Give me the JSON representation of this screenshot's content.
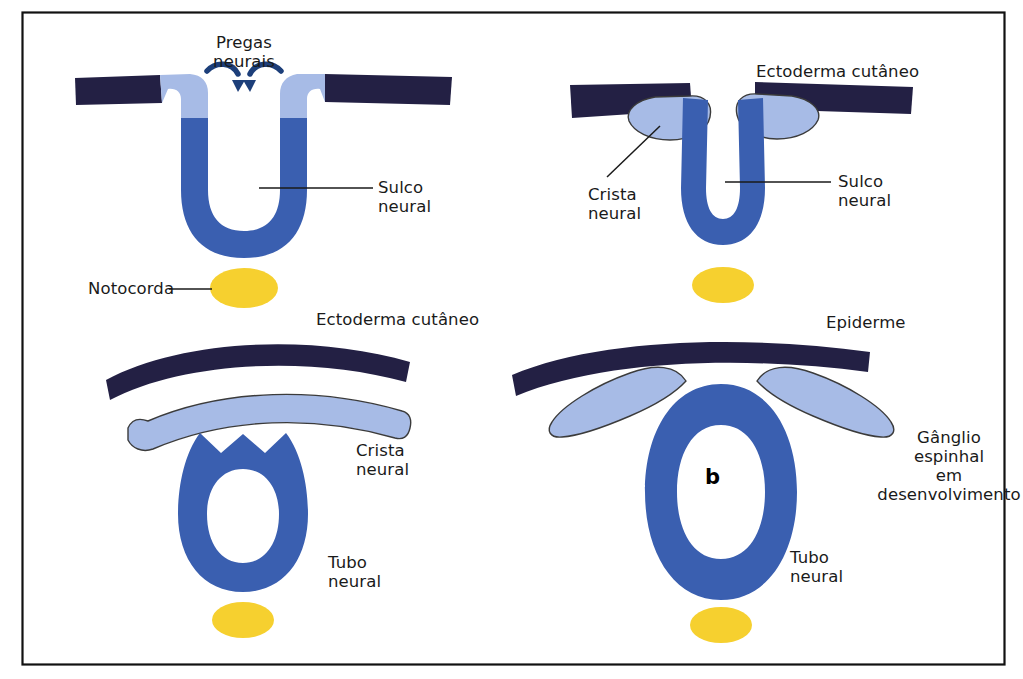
{
  "figure": {
    "panel_letter": "b",
    "frame": {
      "color": "#111111",
      "x": 22,
      "y": 12,
      "width": 983,
      "height": 653
    }
  },
  "colors": {
    "surface_ectoderm": "#232044",
    "neural_plate": "#3a5fb0",
    "neural_crest": "#a7bbe6",
    "neural_crest_outline": "#3b3b3b",
    "notochord": "#f6d02f",
    "leader_line": "#1a1a1a",
    "arrow": "#1d3f7a",
    "background": "#ffffff",
    "text": "#1a1a1a"
  },
  "panels": [
    {
      "id": "panel-top-left",
      "stage": "neural-groove-folding",
      "labels": [
        {
          "name": "pregas-neurais",
          "text": "Pregas\nneurais",
          "x": 236,
          "y": 33,
          "align": "center"
        },
        {
          "name": "sulco-neural",
          "text": "Sulco\nneural",
          "x": 378,
          "y": 178,
          "align": "left"
        },
        {
          "name": "notocorda",
          "text": "Notocorda",
          "x": 88,
          "y": 279,
          "align": "left"
        }
      ],
      "annotations": [
        "arrow-left-fold",
        "arrow-right-fold"
      ]
    },
    {
      "id": "panel-top-right",
      "stage": "neural-crest-forming",
      "labels": [
        {
          "name": "ectoderma-cutaneo",
          "text": "Ectoderma cutâneo",
          "x": 756,
          "y": 62,
          "align": "left"
        },
        {
          "name": "crista-neural",
          "text": "Crista\nneural",
          "x": 588,
          "y": 185,
          "align": "left"
        },
        {
          "name": "sulco-neural",
          "text": "Sulco\nneural",
          "x": 838,
          "y": 172,
          "align": "left"
        }
      ]
    },
    {
      "id": "panel-bottom-left",
      "stage": "neural-tube-closed",
      "labels": [
        {
          "name": "ectoderma-cutaneo",
          "text": "Ectoderma cutâneo",
          "x": 316,
          "y": 310,
          "align": "left"
        },
        {
          "name": "crista-neural",
          "text": "Crista\nneural",
          "x": 356,
          "y": 441,
          "align": "left"
        },
        {
          "name": "tubo-neural",
          "text": "Tubo\nneural",
          "x": 328,
          "y": 553,
          "align": "left"
        }
      ]
    },
    {
      "id": "panel-bottom-right",
      "stage": "spinal-ganglion-developing",
      "labels": [
        {
          "name": "epiderme",
          "text": "Epiderme",
          "x": 826,
          "y": 313,
          "align": "left"
        },
        {
          "name": "ganglio-espinhal",
          "text": "Gânglio\nespinhal\nem\ndesenvolvimento",
          "x": 949,
          "y": 428,
          "align": "center"
        },
        {
          "name": "tubo-neural",
          "text": "Tubo\nneural",
          "x": 790,
          "y": 548,
          "align": "left"
        }
      ]
    }
  ],
  "structures": [
    {
      "name": "surface-ectoderm-band",
      "label": "Ectoderma cutâneo"
    },
    {
      "name": "neural-fold",
      "label": "Pregas neurais"
    },
    {
      "name": "neural-groove",
      "label": "Sulco neural"
    },
    {
      "name": "neural-crest",
      "label": "Crista neural"
    },
    {
      "name": "neural-tube",
      "label": "Tubo neural"
    },
    {
      "name": "notochord",
      "label": "Notocorda"
    },
    {
      "name": "epidermis",
      "label": "Epiderme"
    },
    {
      "name": "spinal-ganglion",
      "label": "Gânglio espinhal em desenvolvimento"
    }
  ]
}
